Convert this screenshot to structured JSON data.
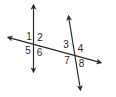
{
  "diagram": {
    "stroke_color": "#2a2a2a",
    "background": "#ffffff",
    "lines": [
      {
        "id": "line-left",
        "x1": 33.5,
        "y1": 5,
        "x2": 33.5,
        "y2": 72,
        "arrows": "both"
      },
      {
        "id": "line-right",
        "x1": 68.5,
        "y1": 16,
        "x2": 80.5,
        "y2": 90,
        "arrows": "both"
      },
      {
        "id": "transversal",
        "x1": 8,
        "y1": 37.3,
        "x2": 101,
        "y2": 62.7,
        "arrows": "both"
      }
    ],
    "intersections": [
      {
        "id": "left",
        "x": 33.5,
        "y": 44.3
      },
      {
        "id": "right",
        "x": 75,
        "y": 55.6
      }
    ],
    "angles": [
      {
        "label": "1",
        "x": 29,
        "y": 37
      },
      {
        "label": "2",
        "x": 40,
        "y": 38
      },
      {
        "label": "5",
        "x": 28,
        "y": 51
      },
      {
        "label": "6",
        "x": 39.5,
        "y": 53
      },
      {
        "label": "3",
        "x": 66,
        "y": 44.5
      },
      {
        "label": "4",
        "x": 80.5,
        "y": 49
      },
      {
        "label": "7",
        "x": 67,
        "y": 61
      },
      {
        "label": "8",
        "x": 81.5,
        "y": 64
      }
    ]
  }
}
